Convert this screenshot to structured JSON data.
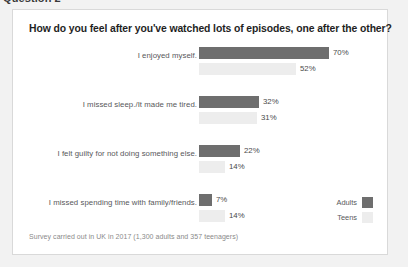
{
  "page": {
    "question_heading": "Question 2",
    "background_color": "#f2f2f2"
  },
  "card": {
    "title": "How do you feel after you've watched lots of episodes, one after the other?",
    "footnote": "Survey carried out in UK in 2017 (1,300 adults and 357 teenagers)",
    "background_color": "#ffffff",
    "border_color": "#d9d9d9"
  },
  "legend": {
    "position": "bottom-right",
    "entries": [
      {
        "label": "Adults",
        "color": "#6e6e6e"
      },
      {
        "label": "Teens",
        "color": "#ededed"
      }
    ]
  },
  "chart_data": {
    "type": "bar",
    "orientation": "horizontal",
    "title": "How do you feel after you've watched lots of episodes, one after the other?",
    "xlabel": "",
    "ylabel": "",
    "xlim": [
      0,
      70
    ],
    "grid": false,
    "legend_position": "bottom-right",
    "value_suffix": "%",
    "categories": [
      "I enjoyed myself.",
      "I missed sleep./It made me tired.",
      "I felt guilty for not doing something else.",
      "I missed spending time with family/friends."
    ],
    "series": [
      {
        "name": "Adults",
        "color": "#6e6e6e",
        "values": [
          70,
          32,
          22,
          7
        ]
      },
      {
        "name": "Teens",
        "color": "#ededed",
        "values": [
          52,
          31,
          14,
          14
        ]
      }
    ],
    "labels": {
      "adults": [
        "70%",
        "32%",
        "22%",
        "7%"
      ],
      "teens": [
        "52%",
        "31%",
        "14%",
        "14%"
      ]
    },
    "annotations": [
      "Survey carried out in UK in 2017 (1,300 adults and 357 teenagers)"
    ]
  }
}
